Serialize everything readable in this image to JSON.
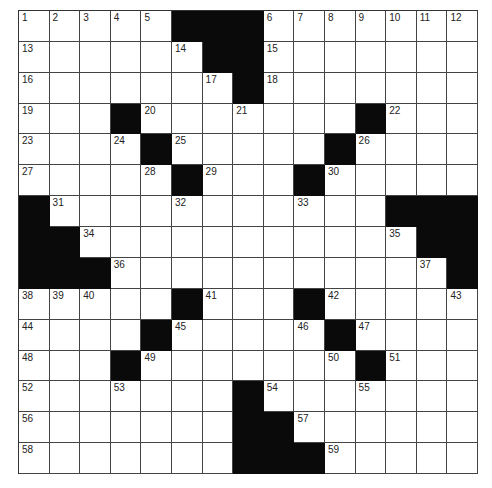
{
  "puzzle": {
    "rows": 15,
    "cols": 15,
    "grid": [
      "1,2,3,4,5,#,#,#,6,7,8,9,10,11,12",
      "13,.,.,.,.,14,#,#,15,.,.,.,.,.,.",
      "16,.,.,.,.,.,17,#,18,.,.,.,.,.,.",
      "19,.,.,#,20,.,.,21,.,.,.,#,22,.,.",
      "23,.,.,24,#,25,.,.,.,.,#,26,.,.,.",
      "27,.,.,.,28,#,29,.,.,#,30,.,.,.,.",
      "#,31,.,.,.,32,.,.,.,33,.,.,#,#,#",
      "#,#,34,.,.,.,.,.,.,.,.,.,35,#,#",
      "#,#,#,36,.,.,.,.,.,.,.,.,.,37,#",
      "38,39,40,.,.,#,41,.,.,#,42,.,.,.,43",
      "44,.,.,.,#,45,.,.,.,46,#,47,.,.,.",
      "48,.,.,#,49,.,.,.,.,.,50,#,51,.,.",
      "52,.,.,53,.,.,.,#,54,.,.,55,.,.,.",
      "56,.,.,.,.,.,.,#,#,57,.,.,.,.,.",
      "58,.,.,.,.,.,.,#,#,#,59,.,.,.,."
    ]
  }
}
